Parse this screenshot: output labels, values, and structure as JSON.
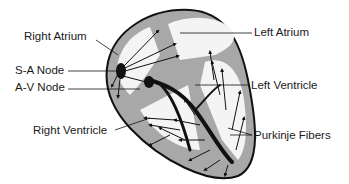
{
  "diagram": {
    "labels": {
      "right_atrium": "Right Atrium",
      "sa_node": "S-A Node",
      "av_node": "A-V Node",
      "right_ventricle": "Right Ventricle",
      "left_atrium": "Left Atrium",
      "left_ventricle": "Left Ventricle",
      "purkinje_fibers": "Purkinje Fibers"
    },
    "colors": {
      "wall": "#a8a8a8",
      "chamber": "#f4f4f4",
      "outline": "#111111",
      "conduction": "#111111"
    }
  }
}
